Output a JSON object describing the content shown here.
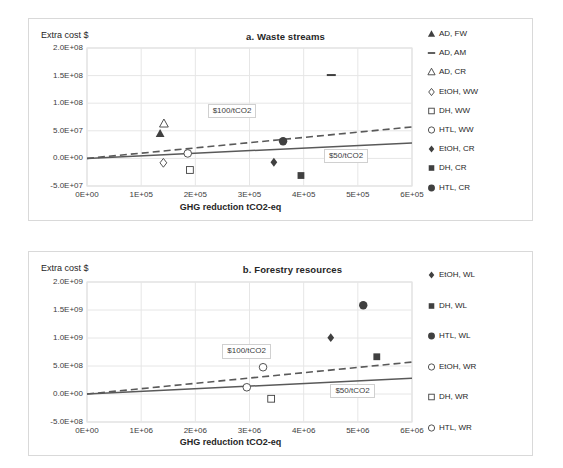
{
  "figure": {
    "width": 563,
    "height": 468,
    "background": "#ffffff",
    "border_color": "#d9d9d9",
    "series_color": "#404040",
    "trend_solid_color": "#595959",
    "trend_dashed_color": "#595959"
  },
  "chart_data": [
    {
      "type": "scatter",
      "title": "a. Waste streams",
      "panel_id": "a",
      "xlabel": "GHG reduction tCO2-eq",
      "ylabel": "Extra cost $",
      "xlim": [
        0,
        600000
      ],
      "ylim": [
        -50000000,
        200000000
      ],
      "grid": true,
      "legend_position": "right",
      "xticks": [
        "0E+00",
        "1E+05",
        "2E+05",
        "3E+05",
        "4E+05",
        "5E+05",
        "6E+05"
      ],
      "xtick_values": [
        0,
        100000,
        200000,
        300000,
        400000,
        500000,
        600000
      ],
      "yticks": [
        "2.0E+08",
        "1.5E+08",
        "1.0E+08",
        "5.0E+07",
        "0.0E+00",
        "-5.0E+07"
      ],
      "ytick_values": [
        200000000,
        150000000,
        100000000,
        50000000,
        0,
        -50000000
      ],
      "series": [
        {
          "name": "AD, FW",
          "marker": "triangle-filled",
          "x": [
            135000
          ],
          "y": [
            45000000
          ]
        },
        {
          "name": "AD, AM",
          "marker": "dash",
          "x": [
            451000
          ],
          "y": [
            151000000
          ]
        },
        {
          "name": "AD, CR",
          "marker": "triangle-open",
          "x": [
            142000
          ],
          "y": [
            63000000
          ]
        },
        {
          "name": "EtOH, WW",
          "marker": "diamond-open",
          "x": [
            141000
          ],
          "y": [
            -8000000
          ]
        },
        {
          "name": "DH, WW",
          "marker": "square-open",
          "x": [
            190000
          ],
          "y": [
            -21000000
          ]
        },
        {
          "name": "HTL, WW",
          "marker": "circle-open",
          "x": [
            186000
          ],
          "y": [
            9000000
          ]
        },
        {
          "name": "EtOH, CR",
          "marker": "diamond-filled",
          "x": [
            345000
          ],
          "y": [
            -7000000
          ]
        },
        {
          "name": "DH, CR",
          "marker": "square-filled",
          "x": [
            395000
          ],
          "y": [
            -31000000
          ]
        },
        {
          "name": "HTL, CR",
          "marker": "circle-filled",
          "x": [
            362000
          ],
          "y": [
            31000000
          ]
        }
      ],
      "trendlines": [
        {
          "name": "$50/tCO2",
          "style": "solid",
          "x": [
            0,
            600000
          ],
          "y": [
            0,
            28000000
          ]
        },
        {
          "name": "$100/tCO2",
          "style": "dashed",
          "x": [
            0,
            600000
          ],
          "y": [
            0,
            57000000
          ]
        }
      ],
      "annotations": [
        {
          "text": "$100/tCO2",
          "x": 268000,
          "y": 86000000
        },
        {
          "text": "$50/tCO2",
          "x": 478000,
          "y": 5000000
        }
      ]
    },
    {
      "type": "scatter",
      "title": "b. Forestry resources",
      "panel_id": "b",
      "xlabel": "GHG reduction tCO2-eq",
      "ylabel": "Extra cost $",
      "xlim": [
        0,
        6000000
      ],
      "ylim": [
        -500000000,
        2000000000
      ],
      "grid": true,
      "legend_position": "right",
      "xticks": [
        "0E+00",
        "1E+06",
        "2E+06",
        "3E+06",
        "4E+06",
        "5E+06",
        "6E+06"
      ],
      "xtick_values": [
        0,
        1000000,
        2000000,
        3000000,
        4000000,
        5000000,
        6000000
      ],
      "yticks": [
        "2.0E+09",
        "1.5E+09",
        "1.0E+09",
        "5.0E+08",
        "0.0E+00",
        "-5.0E+08"
      ],
      "ytick_values": [
        2000000000,
        1500000000,
        1000000000,
        500000000,
        0,
        -500000000
      ],
      "series": [
        {
          "name": "EtOH, WL",
          "marker": "diamond-filled",
          "x": [
            4500000
          ],
          "y": [
            1005000000
          ]
        },
        {
          "name": "DH, WL",
          "marker": "square-filled",
          "x": [
            5350000
          ],
          "y": [
            665000000
          ]
        },
        {
          "name": "HTL, WL",
          "marker": "circle-filled",
          "x": [
            5100000
          ],
          "y": [
            1585000000
          ]
        },
        {
          "name": "EtOH, WR",
          "marker": "circle-open",
          "x": [
            3250000
          ],
          "y": [
            478000000
          ]
        },
        {
          "name": "DH, WR",
          "marker": "square-open",
          "x": [
            3400000
          ],
          "y": [
            -85000000
          ]
        },
        {
          "name": "HTL, WR",
          "marker": "circle-open",
          "x": [
            2950000
          ],
          "y": [
            120000000
          ]
        }
      ],
      "trendlines": [
        {
          "name": "$50/tCO2",
          "style": "solid",
          "x": [
            0,
            6000000
          ],
          "y": [
            0,
            280000000
          ]
        },
        {
          "name": "$100/tCO2",
          "style": "dashed",
          "x": [
            0,
            6000000
          ],
          "y": [
            0,
            570000000
          ]
        }
      ],
      "annotations": [
        {
          "text": "$100/tCO2",
          "x": 2950000,
          "y": 760000000
        },
        {
          "text": "$50/tCO2",
          "x": 4900000,
          "y": 60000000
        }
      ]
    }
  ],
  "panel_a": {
    "title": "a. Waste streams",
    "ylabel": "Extra cost $",
    "xlabel": "GHG reduction tCO2-eq",
    "callout_100": "$100/tCO2",
    "callout_50": "$50/tCO2",
    "yticks": [
      "2.0E+08",
      "1.5E+08",
      "1.0E+08",
      "5.0E+07",
      "0.0E+00",
      "-5.0E+07"
    ],
    "xticks": [
      "0E+00",
      "1E+05",
      "2E+05",
      "3E+05",
      "4E+05",
      "5E+05",
      "6E+05"
    ],
    "legend": [
      {
        "label": "AD, FW",
        "marker": "triangle-filled"
      },
      {
        "label": "AD, AM",
        "marker": "dash"
      },
      {
        "label": "AD, CR",
        "marker": "triangle-open"
      },
      {
        "label": "EtOH, WW",
        "marker": "diamond-open"
      },
      {
        "label": "DH, WW",
        "marker": "square-open"
      },
      {
        "label": "HTL, WW",
        "marker": "circle-open"
      },
      {
        "label": "EtOH, CR",
        "marker": "diamond-filled"
      },
      {
        "label": "DH, CR",
        "marker": "square-filled"
      },
      {
        "label": "HTL, CR",
        "marker": "circle-filled"
      }
    ]
  },
  "panel_b": {
    "title": "b. Forestry resources",
    "ylabel": "Extra cost $",
    "xlabel": "GHG reduction tCO2-eq",
    "callout_100": "$100/tCO2",
    "callout_50": "$50/tCO2",
    "yticks": [
      "2.0E+09",
      "1.5E+09",
      "1.0E+09",
      "5.0E+08",
      "0.0E+00",
      "-5.0E+08"
    ],
    "xticks": [
      "0E+00",
      "1E+06",
      "2E+06",
      "3E+06",
      "4E+06",
      "5E+06",
      "6E+06"
    ],
    "legend": [
      {
        "label": "EtOH, WL",
        "marker": "diamond-filled"
      },
      {
        "label": "DH, WL",
        "marker": "square-filled"
      },
      {
        "label": "HTL, WL",
        "marker": "circle-filled"
      },
      {
        "label": "EtOH, WR",
        "marker": "circle-open"
      },
      {
        "label": "DH, WR",
        "marker": "square-open"
      },
      {
        "label": "HTL, WR",
        "marker": "circle-open"
      }
    ]
  }
}
